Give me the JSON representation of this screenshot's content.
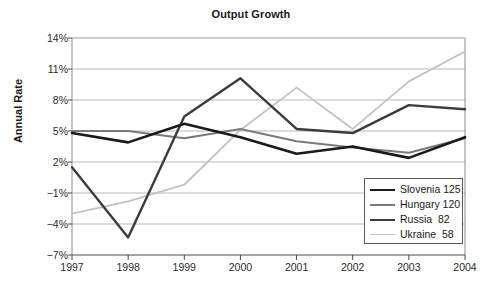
{
  "chart_data": {
    "type": "line",
    "title": "Output Growth",
    "xlabel": "",
    "ylabel": "Annual Rate",
    "categories": [
      "1997",
      "1998",
      "1999",
      "2000",
      "2001",
      "2002",
      "2003",
      "2004"
    ],
    "x": [
      1997,
      1998,
      1999,
      2000,
      2001,
      2002,
      2003,
      2004
    ],
    "ylim": [
      -7,
      14
    ],
    "xlim": [
      1997,
      2004
    ],
    "ytick_labels": [
      "14%",
      "11%",
      "8%",
      "5%",
      "2%",
      "−1%",
      "−4%",
      "−7%"
    ],
    "ytick_values": [
      14,
      11,
      8,
      5,
      2,
      -1,
      -4,
      -7
    ],
    "grid": true,
    "legend_position": "bottom-right",
    "series": [
      {
        "name": "Slovenia 125",
        "legend_label": "Slovenia 125",
        "color": "#1a1a1a",
        "width": 2.6,
        "values": [
          4.8,
          3.9,
          5.7,
          4.4,
          2.8,
          3.5,
          2.4,
          4.4
        ]
      },
      {
        "name": "Hungary 120",
        "legend_label": "Hungary 120",
        "color": "#7a7a7a",
        "width": 2.0,
        "values": [
          5.0,
          5.0,
          4.3,
          5.2,
          4.0,
          3.4,
          2.9,
          4.3
        ]
      },
      {
        "name": "Russia  82",
        "legend_label": "Russia  82",
        "color": "#3c3c3c",
        "width": 2.4,
        "values": [
          1.5,
          -5.3,
          6.4,
          10.1,
          5.2,
          4.8,
          7.5,
          7.1
        ]
      },
      {
        "name": "Ukraine  58",
        "legend_label": "Ukraine  58",
        "color": "#c2c2c2",
        "width": 1.8,
        "values": [
          -3.0,
          -1.8,
          -0.2,
          5.1,
          9.2,
          5.2,
          9.8,
          12.7
        ]
      }
    ]
  },
  "legend": {
    "items": [
      {
        "label": "Slovenia 125"
      },
      {
        "label": "Hungary 120"
      },
      {
        "label": "Russia  82"
      },
      {
        "label": "Ukraine  58"
      }
    ]
  },
  "colors": {
    "plot_border": "#8c8c8c",
    "gridline": "#b9b9b9",
    "background": "#ffffff",
    "text": "#1a1a1a"
  }
}
